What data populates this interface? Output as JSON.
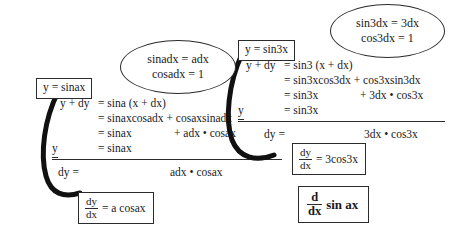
{
  "figure": {
    "title_note": "Derivation of derivative of sine functions",
    "ink_color": "#2b2b2b",
    "background": "#ffffff"
  },
  "left_derivation": {
    "label_box": "y = sinax",
    "lines": [
      {
        "lhs": "y + dy",
        "rel": "= sina (x + dx)",
        "tail": ""
      },
      {
        "lhs": "",
        "rel": "= sinaxcosadx + cosaxsinadx",
        "tail": ""
      },
      {
        "lhs": "",
        "rel": "= sinax",
        "tail": "+ adx • cosax"
      },
      {
        "lhs": "y",
        "rel": "= sinax",
        "tail": ""
      }
    ],
    "subtract_lhs": "y",
    "result_lhs": "dy =",
    "result_rhs": "adx • cosax"
  },
  "left_callout": {
    "line1": "sinadx = adx",
    "line2": "cosadx = 1"
  },
  "left_result_box": {
    "fraction_numerator": "dy",
    "fraction_denominator": "dx",
    "equals_rhs": "= a cosax"
  },
  "right_derivation": {
    "label_box": "y = sin3x",
    "lines": [
      {
        "lhs": "y + dy",
        "rel": "= sin3 (x + dx)",
        "tail": ""
      },
      {
        "lhs": "",
        "rel": "= sin3xcos3dx + cos3xsin3dx",
        "tail": ""
      },
      {
        "lhs": "",
        "rel": "= sin3x",
        "tail": "+ 3dx • cos3x"
      },
      {
        "lhs": "y",
        "rel": "= sin3x",
        "tail": ""
      }
    ],
    "subtract_lhs": "y",
    "result_lhs": "dy =",
    "result_rhs": "3dx • cos3x"
  },
  "right_callout": {
    "line1": "sin3dx = 3dx",
    "line2": "cos3dx = 1"
  },
  "right_result_box": {
    "fraction_numerator": "dy",
    "fraction_denominator": "dx",
    "equals_rhs": "= 3cos3x"
  },
  "general_result_box": {
    "fraction_numerator": "d",
    "fraction_denominator": "dx",
    "operand": "sin ax"
  }
}
